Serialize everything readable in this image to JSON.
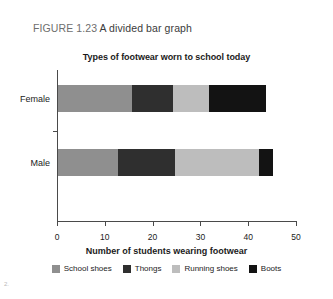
{
  "figure": {
    "label": "FIGURE 1.23",
    "caption": "A divided bar graph"
  },
  "page_artifact": "2.",
  "chart_data": {
    "type": "bar",
    "orientation": "horizontal",
    "stacked": true,
    "title": "Types of footwear worn to school today",
    "xlabel": "Number of students wearing footwear",
    "ylabel": "",
    "categories": [
      "Female",
      "Male"
    ],
    "series": [
      {
        "name": "School shoes",
        "color": "#8f8f8f",
        "values": [
          15.5,
          12.5
        ]
      },
      {
        "name": "Thongs",
        "color": "#2f2f2f",
        "values": [
          8.5,
          12.0
        ]
      },
      {
        "name": "Running shoes",
        "color": "#bdbdbd",
        "values": [
          7.5,
          17.5
        ]
      },
      {
        "name": "Boots",
        "color": "#131313",
        "values": [
          12.0,
          3.0
        ]
      }
    ],
    "totals": [
      43.5,
      45.0
    ],
    "xlim": [
      0,
      50
    ],
    "xticks": [
      0,
      10,
      20,
      30,
      40,
      50
    ],
    "xtick_labels": [
      "0",
      "10",
      "20",
      "30",
      "40",
      "50"
    ],
    "grid": false,
    "legend_position": "bottom"
  }
}
